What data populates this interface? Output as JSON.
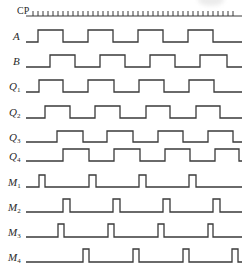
{
  "diagram": {
    "type": "timing_diagram",
    "stroke_color": "#3a3a3a",
    "x_start": 26,
    "x_end": 242,
    "clock": {
      "label": "CP",
      "baseline_y": 16,
      "tick_height": 5,
      "first_tick_x": 33,
      "tick_spacing": 5,
      "tick_count": 41
    },
    "signals": [
      {
        "name": "A",
        "sub": "",
        "high_y": 30,
        "low_y": 42,
        "initial": 0,
        "edges": [
          38,
          63,
          88,
          113,
          138,
          163,
          188,
          213
        ]
      },
      {
        "name": "B",
        "sub": "",
        "high_y": 55,
        "low_y": 67,
        "initial": 0,
        "edges": [
          50,
          75,
          100,
          125,
          150,
          175,
          200,
          227
        ]
      },
      {
        "name": "Q",
        "sub": "1",
        "high_y": 80,
        "low_y": 92,
        "initial": 0,
        "edges": [
          39,
          63,
          88,
          114,
          139,
          164,
          189,
          214
        ]
      },
      {
        "name": "Q",
        "sub": "2",
        "high_y": 106,
        "low_y": 118,
        "initial": 0,
        "edges": [
          45,
          70,
          95,
          120,
          146,
          170,
          196,
          220
        ]
      },
      {
        "name": "Q",
        "sub": "3",
        "high_y": 131,
        "low_y": 142,
        "initial": 0,
        "edges": [
          57,
          83,
          107,
          133,
          158,
          183,
          208,
          233
        ]
      },
      {
        "name": "Q",
        "sub": "4",
        "high_y": 149,
        "low_y": 161,
        "initial": 0,
        "edges": [
          63,
          89,
          114,
          140,
          165,
          190,
          215,
          239
        ]
      },
      {
        "name": "M",
        "sub": "1",
        "high_y": 175,
        "low_y": 187,
        "initial": 0,
        "edges": [
          39,
          45,
          89,
          96,
          139,
          146,
          189,
          196
        ]
      },
      {
        "name": "M",
        "sub": "2",
        "high_y": 199,
        "low_y": 212,
        "initial": 0,
        "edges": [
          63,
          70,
          113,
          120,
          163,
          170,
          213,
          220
        ]
      },
      {
        "name": "M",
        "sub": "3",
        "high_y": 224,
        "low_y": 237,
        "initial": 0,
        "edges": [
          58,
          64,
          108,
          114,
          158,
          164,
          208,
          213
        ]
      },
      {
        "name": "M",
        "sub": "4",
        "high_y": 249,
        "low_y": 262,
        "initial": 0,
        "edges": [
          83,
          89,
          133,
          139,
          183,
          189,
          232,
          238
        ]
      }
    ]
  }
}
